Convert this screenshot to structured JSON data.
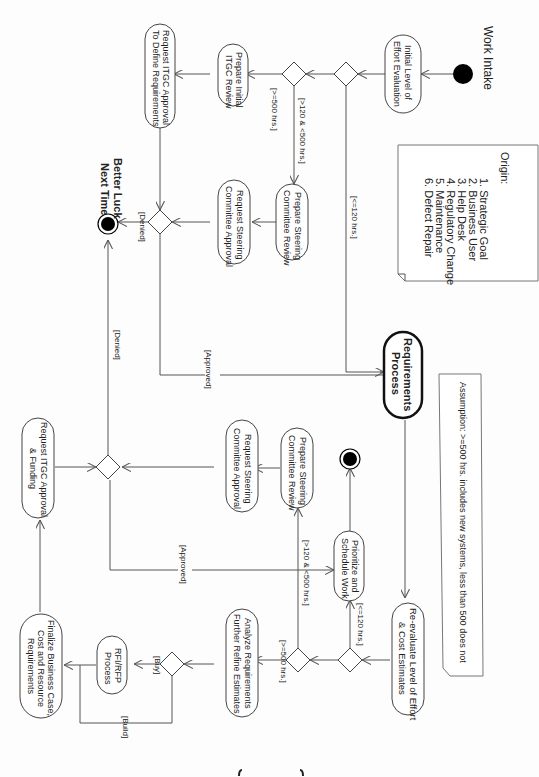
{
  "diagram": {
    "type": "UML activity diagram (rotated 90°)",
    "start": {
      "label": "Work Intake"
    },
    "activities": {
      "initial_eval": [
        "Initial Level of",
        "Effort Evaluation"
      ],
      "prep_itgc": [
        "Prepare Initial",
        "ITGC Review"
      ],
      "req_itgc": [
        "Request ITGC Approval",
        "To Define Requirements"
      ],
      "prep_steer1": [
        "Prepare Steering",
        "Committee Review"
      ],
      "req_steer1": [
        "Request Steering",
        "Committee Approval"
      ],
      "requirements": [
        "Requirements",
        "Process"
      ],
      "reeval": [
        "Re-evaluate Level of Effort",
        "& Cost Estimates"
      ],
      "prioritize": [
        "Prioritize and",
        "Schedule Work"
      ],
      "prep_steer2": [
        "Prepare Steering",
        "Committee Review"
      ],
      "req_steer2": [
        "Request Steering",
        "Committee Approval"
      ],
      "analyze": [
        "Analyze Requirements",
        "Further Refine Estimates"
      ],
      "rfi": [
        "RFI/RFP",
        "Process"
      ],
      "finalize": [
        "Finalize Business Case,",
        "Cost and Resource",
        "Requirements"
      ],
      "req_itgc_fund": [
        "Request ITGC Approval",
        "& Funding"
      ]
    },
    "end_nodes": {
      "better_luck": [
        "Better Luck",
        "Next Time"
      ]
    },
    "guards": {
      "le120": "[<=120 hrs.]",
      "mid": "[>120 & <500 hrs.]",
      "ge500": "[>=500 hrs.]",
      "denied": "[Denied]",
      "approved": "[Approved]",
      "buy": "[Buy]",
      "build": "[Build]"
    },
    "notes": {
      "origin_title": "Origin:",
      "origin_items": [
        "1. Strategic Goal",
        "2. Business User",
        "3. Help Desk",
        "4. Regulatory Change",
        "5. Maintenance",
        "6. Defect Repair"
      ],
      "assumption": "Assumption: >=500 hrs. includes new systems, less than 500 does not"
    },
    "page_number_mark": "{ ... }"
  }
}
